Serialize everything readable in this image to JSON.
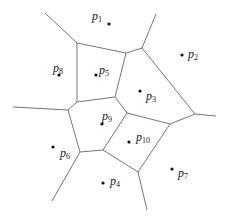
{
  "diagram": {
    "type": "voronoi",
    "edge_color": "#777777",
    "point_color": "#111111",
    "sites": [
      {
        "id": "p1",
        "base": "p",
        "sub": "1",
        "x": 109,
        "y": 24,
        "lx": 92,
        "ly": 10
      },
      {
        "id": "p2",
        "base": "p",
        "sub": "2",
        "x": 182,
        "y": 55,
        "lx": 188,
        "ly": 48
      },
      {
        "id": "p3",
        "base": "p",
        "sub": "3",
        "x": 140,
        "y": 91,
        "lx": 146,
        "ly": 90
      },
      {
        "id": "p4",
        "base": "p",
        "sub": "4",
        "x": 103,
        "y": 183,
        "lx": 110,
        "ly": 175
      },
      {
        "id": "p5",
        "base": "p",
        "sub": "5",
        "x": 96,
        "y": 75,
        "lx": 99,
        "ly": 64
      },
      {
        "id": "p6",
        "base": "p",
        "sub": "6",
        "x": 53,
        "y": 147,
        "lx": 60,
        "ly": 147
      },
      {
        "id": "p7",
        "base": "p",
        "sub": "7",
        "x": 172,
        "y": 169,
        "lx": 178,
        "ly": 167
      },
      {
        "id": "p8",
        "base": "p",
        "sub": "8",
        "x": 59,
        "y": 75,
        "lx": 53,
        "ly": 62
      },
      {
        "id": "p9",
        "base": "p",
        "sub": "9",
        "x": 102,
        "y": 124,
        "lx": 102,
        "ly": 110
      },
      {
        "id": "p10",
        "base": "p",
        "sub": "10",
        "x": 129,
        "y": 142,
        "lx": 136,
        "ly": 131
      }
    ],
    "edges": [
      [
        45,
        13,
        77,
        43
      ],
      [
        77,
        43,
        126,
        53
      ],
      [
        126,
        53,
        142,
        48
      ],
      [
        142,
        48,
        156,
        14
      ],
      [
        142,
        48,
        195,
        114
      ],
      [
        195,
        114,
        216,
        116
      ],
      [
        195,
        114,
        170,
        124
      ],
      [
        170,
        124,
        127,
        113
      ],
      [
        127,
        113,
        115,
        97
      ],
      [
        115,
        97,
        77,
        102
      ],
      [
        77,
        102,
        77,
        43
      ],
      [
        115,
        97,
        126,
        53
      ],
      [
        77,
        102,
        68,
        110
      ],
      [
        68,
        110,
        13,
        107
      ],
      [
        68,
        110,
        80,
        152
      ],
      [
        80,
        152,
        52,
        201
      ],
      [
        80,
        152,
        103,
        150
      ],
      [
        103,
        150,
        127,
        113
      ],
      [
        103,
        150,
        138,
        172
      ],
      [
        138,
        172,
        170,
        124
      ],
      [
        138,
        172,
        147,
        210
      ]
    ]
  }
}
